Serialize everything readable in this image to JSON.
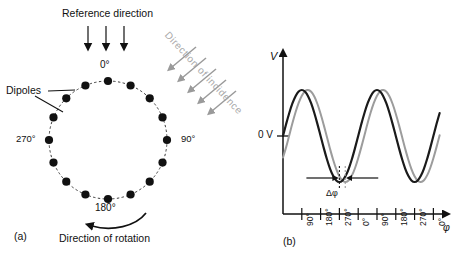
{
  "figure": {
    "caption_a": "(a)",
    "caption_b": "(b)"
  },
  "panel_a": {
    "reference_label": "Reference direction",
    "dipoles_label": "Dipoles",
    "incidence_label": "Direction of incidence",
    "rotation_label": "Direction of rotation",
    "angle_top": "0°",
    "angle_right": "90°",
    "angle_bottom": "180°",
    "angle_left": "270°",
    "dipole_count": 16,
    "reference_arrow_count": 3,
    "incidence_arrow_count": 5,
    "colors": {
      "dipole": "#111111",
      "circle": "#333333",
      "reference_arrow": "#111111",
      "incidence_arrow": "#9a9a9a",
      "incidence_text": "#a8a8a8"
    }
  },
  "chart_data": {
    "type": "line",
    "title": "",
    "xlabel": "φ",
    "ylabel": "V",
    "y_zero_label": "0 V",
    "delta_label": "Δφ",
    "grid": false,
    "legend": "none",
    "x_tick_labels": [
      "90°",
      "180°",
      "270°",
      "0°",
      "90°",
      "180°",
      "270°",
      "0°"
    ],
    "x_tick_values": [
      90,
      180,
      270,
      360,
      450,
      540,
      630,
      720
    ],
    "xlim": [
      0,
      790
    ],
    "ylim": [
      -1.25,
      1.25
    ],
    "y_zero": 0,
    "phase_shift_deg": 28,
    "series": [
      {
        "name": "reference-signal",
        "color": "#1a1a1a",
        "width": 2.2,
        "phase_deg": 0,
        "amplitude": 1,
        "x": [
          0,
          15,
          30,
          45,
          60,
          75,
          90,
          105,
          120,
          135,
          150,
          165,
          180,
          195,
          210,
          225,
          240,
          255,
          270,
          285,
          300,
          315,
          330,
          345,
          360,
          375,
          390,
          405,
          420,
          435,
          450,
          465,
          480,
          495,
          510,
          525,
          540,
          555,
          570,
          585,
          600,
          615,
          630,
          645,
          660,
          675,
          690,
          705,
          720,
          735,
          750
        ],
        "values": [
          0,
          0.259,
          0.5,
          0.707,
          0.866,
          0.966,
          1,
          0.966,
          0.866,
          0.707,
          0.5,
          0.259,
          0,
          -0.259,
          -0.5,
          -0.707,
          -0.866,
          -0.966,
          -1,
          -0.966,
          -0.866,
          -0.707,
          -0.5,
          -0.259,
          0,
          0.259,
          0.5,
          0.707,
          0.866,
          0.966,
          1,
          0.966,
          0.866,
          0.707,
          0.5,
          0.259,
          0,
          -0.259,
          -0.5,
          -0.707,
          -0.866,
          -0.966,
          -1,
          -0.966,
          -0.866,
          -0.707,
          -0.5,
          -0.259,
          0,
          0.259,
          0.5
        ]
      },
      {
        "name": "shifted-signal",
        "color": "#9c9c9c",
        "width": 2.0,
        "phase_deg": -28,
        "amplitude": 1,
        "x": [
          0,
          15,
          30,
          45,
          60,
          75,
          90,
          105,
          120,
          135,
          150,
          165,
          180,
          195,
          210,
          225,
          240,
          255,
          270,
          285,
          300,
          315,
          330,
          345,
          360,
          375,
          390,
          405,
          420,
          435,
          450,
          465,
          480,
          495,
          510,
          525,
          540,
          555,
          570,
          585,
          600,
          615,
          630,
          645,
          660,
          675,
          690,
          705,
          720,
          735,
          750
        ],
        "values": [
          -0.469,
          -0.242,
          0.017,
          0.276,
          0.515,
          0.719,
          0.875,
          0.974,
          1.0,
          0.961,
          0.857,
          0.695,
          0.484,
          0.242,
          -0.017,
          -0.276,
          -0.515,
          -0.719,
          -0.875,
          -0.974,
          -1.0,
          -0.961,
          -0.857,
          -0.695,
          -0.484,
          -0.242,
          0.017,
          0.276,
          0.515,
          0.719,
          0.875,
          0.974,
          1.0,
          0.961,
          0.857,
          0.695,
          0.484,
          0.242,
          -0.017,
          -0.276,
          -0.515,
          -0.719,
          -0.875,
          -0.974,
          -1.0,
          -0.961,
          -0.857,
          -0.695,
          -0.484,
          -0.242,
          0.017
        ]
      }
    ],
    "annotation": {
      "marker_x_black": 270,
      "marker_x_gray": 298,
      "label": "Δφ"
    }
  }
}
